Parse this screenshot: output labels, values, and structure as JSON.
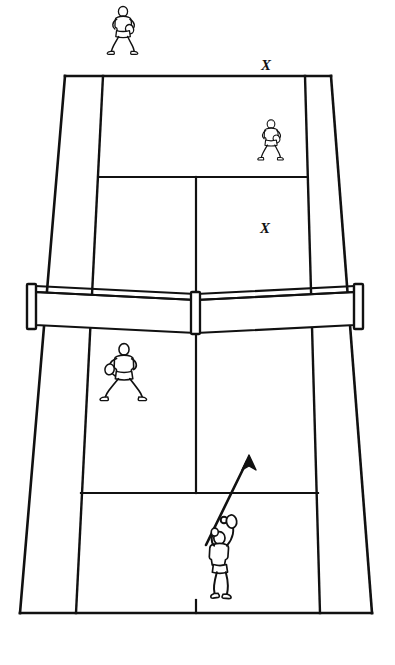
{
  "diagram": {
    "surface_color": "#ffffff",
    "line_color": "#111111",
    "figure_color": "#111111"
  },
  "court": {
    "name": "tennis-court",
    "perspective": "near-end wide, far-end narrow",
    "lines": {
      "far_baseline": {
        "label": "far baseline",
        "y": 76,
        "x1": 65,
        "x2": 331
      },
      "near_baseline": {
        "label": "near baseline",
        "y": 613,
        "x1": 20,
        "x2": 372
      },
      "left_doubles_sideline": {
        "label": "left doubles sideline",
        "x1": 65,
        "y1": 76,
        "x2": 20,
        "y2": 613
      },
      "right_doubles_sideline": {
        "label": "right doubles sideline",
        "x1": 331,
        "y1": 76,
        "x2": 372,
        "y2": 613
      },
      "left_singles_sideline": {
        "label": "left singles sideline",
        "x1": 103,
        "y1": 76,
        "x2": 76,
        "y2": 613
      },
      "right_singles_sideline": {
        "label": "right singles sideline",
        "x1": 305,
        "y1": 76,
        "x2": 320,
        "y2": 613
      },
      "far_service_line": {
        "label": "far service line",
        "y": 177,
        "x1": 99,
        "x2": 307
      },
      "near_service_line": {
        "label": "near service line",
        "y": 493,
        "x1": 81,
        "x2": 318
      },
      "center_service_line_far": {
        "label": "far center service line",
        "x1": 196,
        "y1": 177,
        "x2": 196,
        "y2": 300
      },
      "center_service_line_near": {
        "label": "near center service line",
        "x1": 196,
        "y1": 330,
        "x2": 196,
        "y2": 493
      },
      "center_mark": {
        "label": "baseline center mark",
        "x": 196,
        "y1": 600,
        "y2": 613
      }
    }
  },
  "net": {
    "name": "tennis-net",
    "left_post_x": 30,
    "right_post_x": 360,
    "top_y": 288,
    "bottom_y": 330,
    "has_center_strap": true,
    "has_top_band": true
  },
  "players": [
    {
      "id": "far-baseline-player",
      "label": "far deep player",
      "side": "far",
      "stance": "ready stance with racket",
      "x": 123,
      "y": 40,
      "scale": 0.62
    },
    {
      "id": "far-service-line-player",
      "label": "far net / service-line player",
      "side": "far",
      "stance": "split step ready stance with racket",
      "x": 271,
      "y": 148,
      "scale": 0.52
    },
    {
      "id": "near-net-player",
      "label": "near net player (server's partner)",
      "side": "near",
      "stance": "wide ready stance with racket",
      "x": 124,
      "y": 383,
      "scale": 0.7
    },
    {
      "id": "server",
      "label": "server at baseline",
      "side": "near",
      "stance": "service toss, racket raised",
      "x": 221,
      "y": 578,
      "scale": 0.8
    }
  ],
  "ball": {
    "name": "tossed-ball",
    "label": "tossed ball",
    "x": 224,
    "y": 520,
    "radius": 3.2
  },
  "arrow": {
    "name": "serve-direction-arrow",
    "label": "serve direction",
    "from_x": 206,
    "from_y": 545,
    "to_x": 249,
    "to_y": 456
  },
  "target_marks": [
    {
      "id": "target-x-deep",
      "label": "X",
      "x": 266,
      "y": 66,
      "note": "target mark behind far baseline"
    },
    {
      "id": "target-x-service-box",
      "label": "X",
      "x": 265,
      "y": 229,
      "note": "target mark inside far service box"
    }
  ]
}
